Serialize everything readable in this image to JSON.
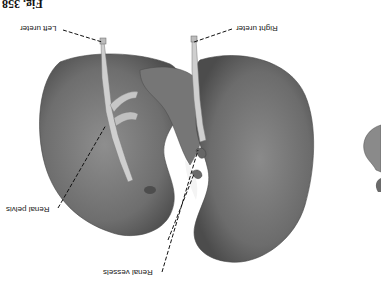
{
  "figure": {
    "number": "Fig. 358",
    "orientation": "rotated 180 degrees"
  },
  "labels": {
    "left_ureter": "Left ureter",
    "right_ureter": "Right ureter",
    "renal_pelvis": "Renal pelvis",
    "renal_vessels": "Renal vessels"
  },
  "colors": {
    "background": "#ffffff",
    "kidney_fill": "#7a7a7a",
    "kidney_shadow": "#555555",
    "ureter": "#c8c8c8",
    "leader_line": "#111111"
  }
}
